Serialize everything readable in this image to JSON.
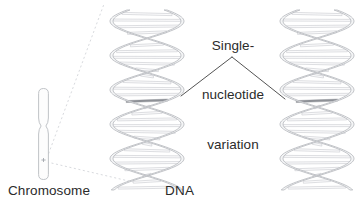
{
  "figure": {
    "kind": "biology-diagram",
    "background_color": "#ffffff",
    "text_color": "#2b2b2b"
  },
  "labels": {
    "chromosome": "Chromosome",
    "dna": "DNA",
    "snv_line1": "Single-",
    "snv_line2": "nucleotide",
    "snv_line3": "variation"
  },
  "colors": {
    "outline": "#b9bcc1",
    "backbone_fill": "#f4f5f6",
    "rung_stroke": "#c2c5ca",
    "rung_fill": "#fbfbfc",
    "variant_rung": "#8d9096",
    "leader_line": "#4a4a4a",
    "dotted_line": "#d8dade",
    "chromosome_outline": "#b9bcc1",
    "chromosome_fill": "#fdfdfd",
    "centromere_mark": "#9aa0a6"
  },
  "elements": {
    "chromosome": {
      "name": "chromosome",
      "x": 38,
      "y": 88,
      "width": 11,
      "height": 92,
      "centromere_y": 126,
      "marker_y": 160
    },
    "dna_left": {
      "name": "dna-helix-left",
      "x": 108,
      "y": 10,
      "width": 78,
      "height": 180,
      "variant_rung_y": 98
    },
    "dna_right": {
      "name": "dna-helix-right",
      "x": 278,
      "y": 10,
      "width": 78,
      "height": 180,
      "variant_rung_y": 98
    },
    "leader_apex": {
      "x": 232,
      "y": 57
    },
    "leader_left_end": {
      "x": 181,
      "y": 96
    },
    "leader_right_end": {
      "x": 285,
      "y": 99
    },
    "zoom_guide_top": {
      "x1": 47,
      "y1": 158,
      "x2": 104,
      "y2": 4
    },
    "zoom_guide_bottom": {
      "x1": 47,
      "y1": 162,
      "x2": 133,
      "y2": 182
    }
  }
}
